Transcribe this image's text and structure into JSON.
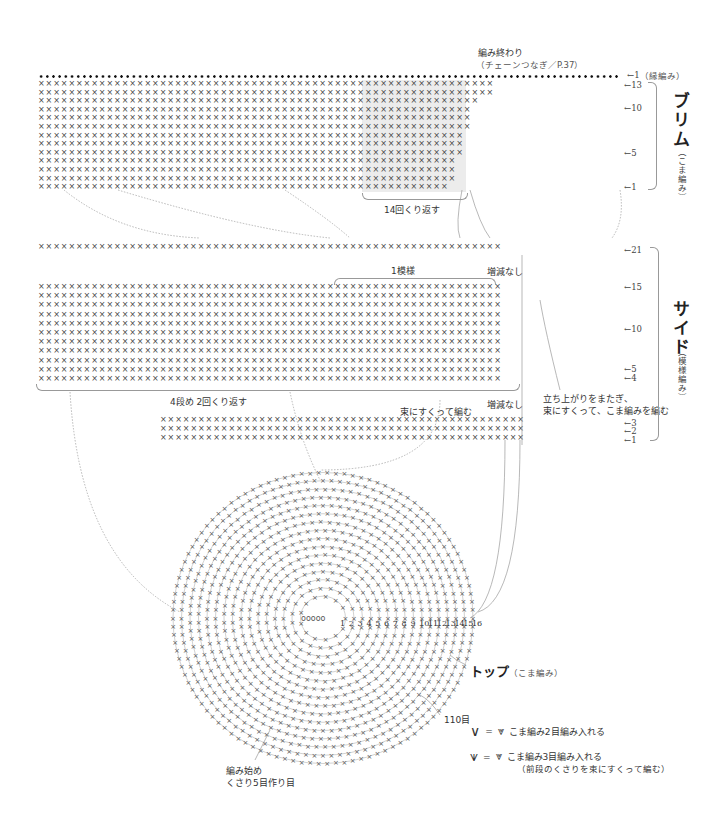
{
  "brim": {
    "title": "ブリム",
    "subtitle": "（こま編み）",
    "end_label_line1": "編み終わり",
    "end_label_line2": "（チェーンつなぎ／P.37）",
    "edge_label": "（縁編み）",
    "edge_row_num": "1",
    "row_nums": [
      "13",
      "10",
      "5",
      "1"
    ],
    "repeat_label": "14回くり返す",
    "stitch_rows": 13,
    "stitch_symbol": "×"
  },
  "side": {
    "title": "サイド",
    "subtitle": "（模様編み）",
    "row_nums": [
      "21",
      "15",
      "10",
      "5",
      "4",
      "3",
      "2",
      "1"
    ],
    "pattern_label": "1模様",
    "no_change_label_top": "増減なし",
    "no_change_label_bottom": "増減なし",
    "repeat_label": "4段め 2回くり返す",
    "bundle_note": "束にすくって編む",
    "rise_note_line1": "立ち上がりをまたぎ、",
    "rise_note_line2": "束にすくって、こま編みを編む",
    "stitch_symbol": "×"
  },
  "top": {
    "title": "トップ",
    "subtitle": "（こま編み）",
    "round_nums": [
      "1",
      "2",
      "3",
      "4",
      "5",
      "6",
      "7",
      "8",
      "9",
      "10",
      "11",
      "12",
      "13",
      "14",
      "15",
      "16"
    ],
    "stitch_count_label": "110目",
    "start_label_line1": "編み始め",
    "start_label_line2": "くさり5目作り目"
  },
  "legend": {
    "items": [
      {
        "symbol": "V",
        "equals": "=",
        "text": "こま編み2目編み入れる",
        "note": ""
      },
      {
        "symbol": "W",
        "equals": "=",
        "text": "こま編み3目編み入れる",
        "note": "（前段のくさりを束にすくって編む）"
      }
    ]
  },
  "colors": {
    "ink": "#333333",
    "stitch": "#444444",
    "guide": "#999999",
    "shade": "#ececec"
  }
}
